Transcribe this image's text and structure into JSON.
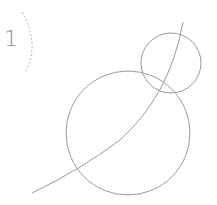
{
  "step": {
    "number": "1"
  },
  "drawing": {
    "stroke_color": "#9a9a9a",
    "dashed_arc_color": "#b0b0b0",
    "small_circle": {
      "cx": 171,
      "cy": 63,
      "r": 30
    },
    "large_circle": {
      "cx": 128,
      "cy": 133,
      "r": 62
    },
    "curve": {
      "start": [
        32,
        193
      ],
      "end": [
        183,
        22
      ]
    }
  }
}
